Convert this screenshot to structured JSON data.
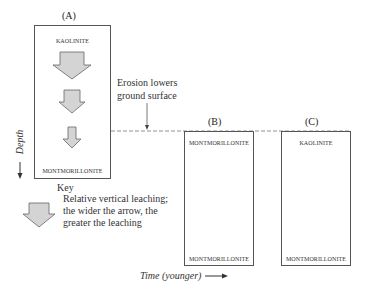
{
  "diagram": {
    "panels": [
      {
        "id": "A",
        "label": "(A)",
        "top_mineral": "KAOLINITE",
        "bottom_mineral": "MONTMORILLONITE"
      },
      {
        "id": "B",
        "label": "(B)",
        "top_mineral": "MONTMORILLONITE",
        "bottom_mineral": "MONTMORILLONITE"
      },
      {
        "id": "C",
        "label": "(C)",
        "top_mineral": "KAOLINITE",
        "bottom_mineral": "MONTMORILLONITE"
      }
    ],
    "erosion_note": {
      "line1": "Erosion lowers",
      "line2": "ground surface"
    },
    "axes": {
      "depth": "Depth",
      "time": "Time (younger)"
    },
    "key": {
      "title": "Key",
      "line1": "Relative vertical leaching;",
      "line2": "the wider the arrow,  the",
      "line3": "greater the leaching"
    },
    "colors": {
      "arrow_fill": "#d4d4d4",
      "arrow_stroke": "#666666",
      "box_border": "#555555",
      "dashed_line": "#777777"
    }
  }
}
